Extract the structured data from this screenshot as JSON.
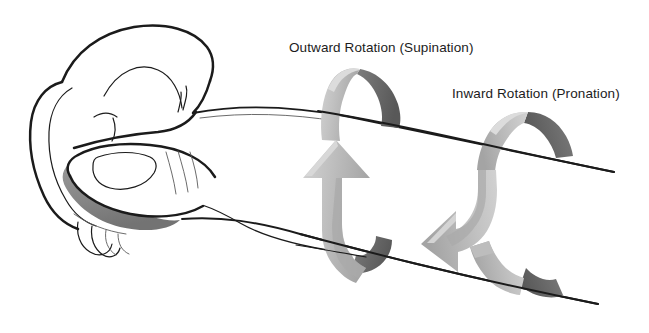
{
  "figure": {
    "background_color": "#ffffff",
    "width": 649,
    "height": 333
  },
  "labels": {
    "supination": "Outward Rotation (Supination)",
    "pronation": "Inward Rotation (Pronation)"
  },
  "colors": {
    "outline": "#1b1b1b",
    "soft_outline": "#5a5a5a",
    "arrow_front_light": "#c9c9c9",
    "arrow_front_mid": "#b6b6b6",
    "arrow_front_dark": "#a2a2a2",
    "arrow_back_face": "#6f6f6f",
    "arrow_back_face_dark": "#595959",
    "shadow_gray": "#8d8d8d",
    "nail_shadow": "#b9b9b9",
    "text": "#1c1c1c"
  },
  "parts": {
    "hand": "closed-fist-left-hand",
    "forearm": "forearm-extending-right",
    "thumb": "thumb-with-nail",
    "arrow_left": "supination-rotation-ribbon-arrow-up",
    "arrow_right": "pronation-rotation-ribbon-arrow-down"
  },
  "annotations": [
    {
      "id": "supination",
      "text": "Outward Rotation (Supination)",
      "x": 289,
      "y": 52,
      "points_to": "arrow-supination"
    },
    {
      "id": "pronation",
      "text": "Inward Rotation (Pronation)",
      "x": 452,
      "y": 98,
      "points_to": "arrow-pronation"
    }
  ]
}
